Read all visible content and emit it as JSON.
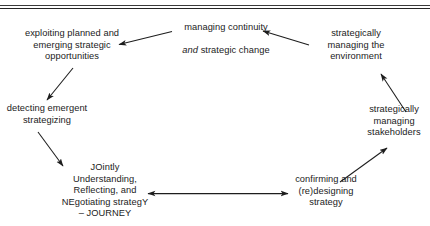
{
  "figure": {
    "type": "cycle-diagram",
    "clipped_header_text": "",
    "nodes": [
      {
        "id": "managing-continuity",
        "label_part1": "managing continuity",
        "label_italic": "and",
        "label_part2": " strategic change",
        "position": "top-center"
      },
      {
        "id": "exploiting-opportunities",
        "label": "exploiting planned and\nemerging strategic\nopportunities",
        "position": "top-left"
      },
      {
        "id": "strategically-managing-environment",
        "label": "strategically\nmanaging the\nenvironment",
        "position": "top-right"
      },
      {
        "id": "detecting-emergent-strategizing",
        "label": "detecting emergent\nstrategizing",
        "position": "left"
      },
      {
        "id": "strategically-managing-stakeholders",
        "label": "strategically\nmanaging\nstakeholders",
        "position": "right"
      },
      {
        "id": "journey",
        "label": "JOintly\nUnderstanding,\nReflecting, and\nNEgotiating strategY\n– JOURNEY",
        "position": "bottom-left"
      },
      {
        "id": "confirming-redesigning-strategy",
        "label": "confirming and\n(re)designing\nstrategy",
        "position": "bottom-right"
      }
    ],
    "arrows": [
      {
        "id": "arrow-continuity-to-exploiting",
        "direction": "left",
        "from": "managing-continuity",
        "to": "exploiting-opportunities"
      },
      {
        "id": "arrow-environment-to-continuity",
        "direction": "left",
        "from": "strategically-managing-environment",
        "to": "managing-continuity"
      },
      {
        "id": "arrow-exploiting-to-detecting",
        "direction": "down-left",
        "from": "exploiting-opportunities",
        "to": "detecting-emergent-strategizing"
      },
      {
        "id": "arrow-detecting-to-journey",
        "direction": "down-right",
        "from": "detecting-emergent-strategizing",
        "to": "journey"
      },
      {
        "id": "arrow-journey-confirming",
        "direction": "bidirectional",
        "from": "journey",
        "to": "confirming-redesigning-strategy"
      },
      {
        "id": "arrow-confirming-to-stakeholders",
        "direction": "up-right",
        "from": "confirming-redesigning-strategy",
        "to": "strategically-managing-stakeholders"
      },
      {
        "id": "arrow-stakeholders-to-environment",
        "direction": "up-left",
        "from": "strategically-managing-stakeholders",
        "to": "strategically-managing-environment"
      }
    ],
    "colors": {
      "text": "#1b1b1b",
      "arrow": "#1d1d1d",
      "rule": "#303030",
      "background": "#ffffff"
    }
  }
}
